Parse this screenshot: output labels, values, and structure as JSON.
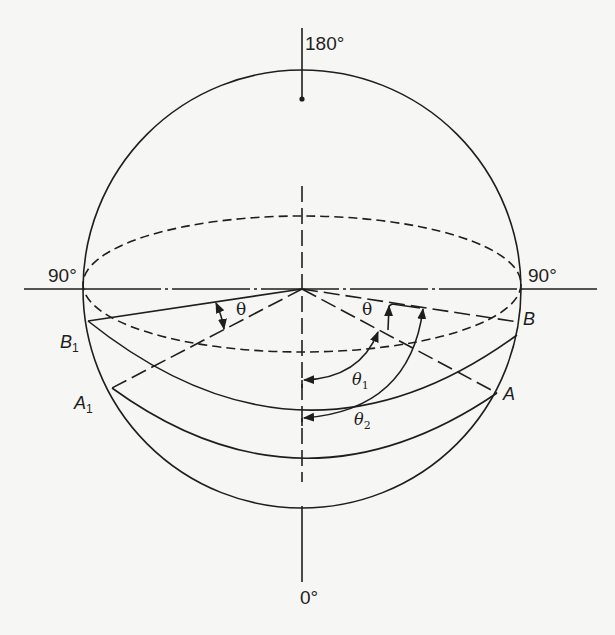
{
  "diagram": {
    "type": "sphere-angle-diagram",
    "labels": {
      "top_angle": "180°",
      "bottom_angle": "0°",
      "left_angle": "90°",
      "right_angle": "90°",
      "point_B": "B",
      "point_B1_base": "B",
      "point_B1_sub": "1",
      "point_A": "A",
      "point_A1_base": "A",
      "point_A1_sub": "1",
      "theta_left": "θ",
      "theta_right": "θ",
      "theta1_base": "θ",
      "theta1_sub": "1",
      "theta2_base": "θ",
      "theta2_sub": "2"
    },
    "colors": {
      "ink": "#1e1e1e",
      "paper": "#f6f6f5"
    }
  }
}
